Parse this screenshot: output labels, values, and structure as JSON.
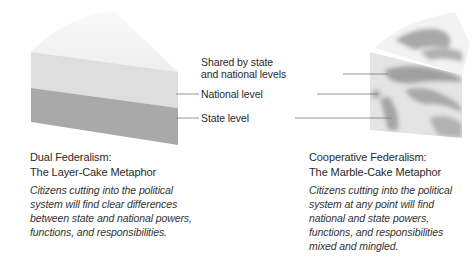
{
  "figure": {
    "left_panel": {
      "title_line1": "Dual Federalism:",
      "title_line2": "The Layer-Cake Metaphor",
      "caption": [
        "Citizens cutting into the political",
        "system will find clear differences",
        "between state and national powers,",
        "functions, and responsibilities."
      ],
      "layers": {
        "top_color": "#f0f0f0",
        "national_color": "#dddddd",
        "state_color": "#a9a9a9"
      }
    },
    "center_labels": {
      "shared_line1": "Shared by state",
      "shared_line2": "and national levels",
      "national": "National level",
      "state": "State level"
    },
    "right_panel": {
      "title_line1": "Cooperative Federalism:",
      "title_line2": "The Marble-Cake Metaphor",
      "caption": [
        "Citizens cutting into the political",
        "system at any point will find",
        "national and state powers,",
        "functions, and responsibilities",
        "mixed and mingled."
      ],
      "colors": {
        "light": "#e6e6e6",
        "swirl": "#a8a8a8"
      }
    },
    "leader_line_color": "#777777"
  }
}
